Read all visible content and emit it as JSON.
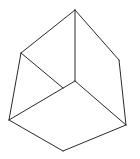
{
  "figure": {
    "width": 140,
    "height": 159,
    "background": "#ffffff",
    "stroke_color": "#2a2a2a",
    "vertices": {
      "top": [
        75,
        10
      ],
      "upper_left": [
        21,
        53
      ],
      "upper_right": [
        119,
        60
      ],
      "center": [
        75,
        81
      ],
      "mid_left": [
        63,
        88
      ],
      "lower_left": [
        9,
        120
      ],
      "lower_right": [
        126,
        125
      ],
      "bottom": [
        63,
        151
      ]
    },
    "edges": [
      {
        "name": "edge-top-upper-left",
        "from": "top",
        "to": "upper_left"
      },
      {
        "name": "edge-top-upper-right",
        "from": "top",
        "to": "upper_right"
      },
      {
        "name": "edge-top-center",
        "from": "top",
        "to": "center"
      },
      {
        "name": "edge-upper-left-lower-left",
        "from": "upper_left",
        "to": "lower_left"
      },
      {
        "name": "edge-upper-left-mid-left",
        "from": "upper_left",
        "to": "mid_left"
      },
      {
        "name": "edge-upper-right-lower-right",
        "from": "upper_right",
        "to": "lower_right"
      },
      {
        "name": "edge-center-lower-right",
        "from": "center",
        "to": "lower_right"
      },
      {
        "name": "edge-center-lower-left",
        "from": "center",
        "to": "lower_left"
      },
      {
        "name": "edge-lower-left-bottom",
        "from": "lower_left",
        "to": "bottom"
      },
      {
        "name": "edge-bottom-lower-right",
        "from": "bottom",
        "to": "lower_right"
      }
    ]
  }
}
